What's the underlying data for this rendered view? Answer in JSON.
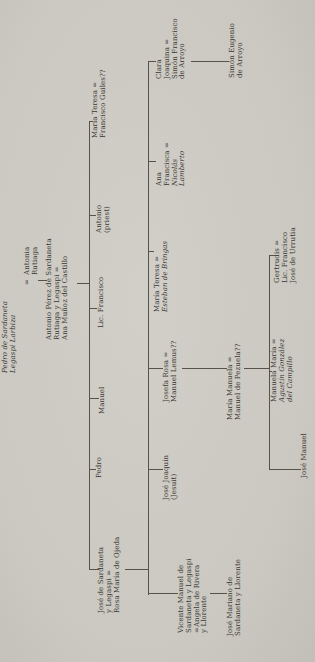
{
  "page": {
    "background_color": "#cdcac3",
    "ink_color": "#3a3732",
    "line_color": "#57534c",
    "rotation_deg": -90
  },
  "tree": {
    "nodes": [
      {
        "id": "pedro-sardaneta-legaspi",
        "x": 289,
        "y": 2,
        "lines": [
          {
            "t": "Pedro de Sardaneta",
            "i": true
          },
          {
            "t": "Legaspi Larbiza",
            "i": true
          }
        ]
      },
      {
        "id": "g1-equals",
        "x": 377,
        "y": 24,
        "lines": [
          {
            "t": "="
          }
        ]
      },
      {
        "id": "antonia-rutiaga",
        "x": 387,
        "y": 24,
        "lines": [
          {
            "t": "Antonia"
          },
          {
            "t": "Rutiaga"
          }
        ]
      },
      {
        "id": "antonio-perez-de-sardaneta",
        "x": 322,
        "y": 46,
        "lines": [
          {
            "t": "Antonio Pérez de Sardaneta"
          },
          {
            "t": "Rutiaga y Legaspi ="
          },
          {
            "t": "Ana Muñoz del Castillo"
          }
        ]
      },
      {
        "id": "jose-de-sardaneta-y-legaspi",
        "x": 49,
        "y": 98,
        "lines": [
          {
            "t": "José de Sardaneta"
          },
          {
            "t": "y Legaspi ="
          },
          {
            "t": "Rosa María de Ojeda"
          }
        ]
      },
      {
        "id": "pedro",
        "x": 184,
        "y": 96,
        "lines": [
          {
            "t": "Pedro"
          }
        ]
      },
      {
        "id": "manuel",
        "x": 248,
        "y": 99,
        "lines": [
          {
            "t": "Manuel"
          }
        ]
      },
      {
        "id": "lic-francisco",
        "x": 334,
        "y": 98,
        "lines": [
          {
            "t": "Lic. Francisco"
          }
        ]
      },
      {
        "id": "antonio-priest",
        "x": 429,
        "y": 96,
        "lines": [
          {
            "t": "Antonio"
          },
          {
            "t": "(priest)"
          }
        ]
      },
      {
        "id": "maria-teresa-guiles",
        "x": 524,
        "y": 92,
        "lines": [
          {
            "t": "María Teresa ="
          },
          {
            "t": "Francisco Guiles??"
          }
        ]
      },
      {
        "id": "vicente-manuel-de-sardaneta",
        "x": 29,
        "y": 178,
        "lines": [
          {
            "t": "Vicente Manuel de"
          },
          {
            "t": "Sardaneta y Legaspi"
          },
          {
            "t": "=Angela de Rivera"
          },
          {
            "t": "y Llorente"
          }
        ]
      },
      {
        "id": "jose-joaquin-jesuit",
        "x": 162,
        "y": 163,
        "lines": [
          {
            "t": "José Joaquín"
          },
          {
            "t": "(Jesuit)"
          }
        ]
      },
      {
        "id": "josefa-rosa",
        "x": 260,
        "y": 163,
        "lines": [
          {
            "t": "Josefa Rosa ="
          },
          {
            "t": "Manuel Lemus??"
          }
        ]
      },
      {
        "id": "maria-teresa-bringas",
        "x": 350,
        "y": 154,
        "lines": [
          {
            "t": "María Teresa ="
          },
          {
            "t": "Esteban de Bringas",
            "i": true
          }
        ]
      },
      {
        "id": "ana-francisca",
        "x": 476,
        "y": 156,
        "lines": [
          {
            "t": "Ana"
          },
          {
            "t": "Francisca ="
          },
          {
            "t": "Nicolás",
            "i": true
          },
          {
            "t": "Lamberto",
            "i": true
          }
        ]
      },
      {
        "id": "clara-joaquina",
        "x": 583,
        "y": 156,
        "lines": [
          {
            "t": "Clara"
          },
          {
            "t": "Joaquina ="
          },
          {
            "t": "Simón Francisco"
          },
          {
            "t": "de Arroyo"
          }
        ]
      },
      {
        "id": "jose-mariano",
        "x": 26,
        "y": 227,
        "lines": [
          {
            "t": "José Mariano de"
          },
          {
            "t": "Sardaneta y Llorente"
          }
        ]
      },
      {
        "id": "maria-manuela",
        "x": 242,
        "y": 227,
        "lines": [
          {
            "t": "María Manuela ="
          },
          {
            "t": "Manuel de Pezuela??"
          }
        ]
      },
      {
        "id": "simon-eugenio-de-arroyo",
        "x": 584,
        "y": 229,
        "lines": [
          {
            "t": "Simón Eugenio"
          },
          {
            "t": "de Arroyo"
          }
        ]
      },
      {
        "id": "jose-manuel",
        "x": 184,
        "y": 301,
        "lines": [
          {
            "t": "José Manuel"
          }
        ]
      },
      {
        "id": "manuela-maria",
        "x": 260,
        "y": 271,
        "lines": [
          {
            "t": "Manuela María ="
          },
          {
            "t": "Agustín González",
            "i": true
          },
          {
            "t": "del Campillo",
            "i": true
          }
        ]
      },
      {
        "id": "gertrudis",
        "x": 379,
        "y": 274,
        "lines": [
          {
            "t": "Gertrudis ="
          },
          {
            "t": "Lic. Francisco"
          },
          {
            "t": "José de Urrutia"
          }
        ]
      }
    ],
    "connectors": [
      {
        "id": "g1-descent",
        "type": "v",
        "x": 381,
        "y": 38,
        "len": 9
      },
      {
        "id": "g2-descent",
        "type": "v",
        "x": 378,
        "y": 77,
        "len": 13
      },
      {
        "id": "gen3-sibling-line",
        "type": "h",
        "x": 92,
        "y": 89,
        "len": 448
      },
      {
        "id": "stub-jose-de-sardaneta",
        "type": "v",
        "x": 92,
        "y": 89,
        "len": 10
      },
      {
        "id": "stub-pedro",
        "type": "v",
        "x": 192,
        "y": 89,
        "len": 7
      },
      {
        "id": "stub-manuel",
        "type": "v",
        "x": 263,
        "y": 89,
        "len": 10
      },
      {
        "id": "stub-lic-francisco",
        "type": "v",
        "x": 353,
        "y": 89,
        "len": 8
      },
      {
        "id": "stub-antonio-priest",
        "type": "v",
        "x": 446,
        "y": 89,
        "len": 7
      },
      {
        "id": "stub-maria-teresa-guiles",
        "type": "v",
        "x": 540,
        "y": 89,
        "len": 4
      },
      {
        "id": "jose-descent",
        "type": "v",
        "x": 92,
        "y": 125,
        "len": 23
      },
      {
        "id": "gen4-sibling-line",
        "type": "h",
        "x": 67,
        "y": 148,
        "len": 533
      },
      {
        "id": "stub-vicente",
        "type": "v",
        "x": 68,
        "y": 148,
        "len": 30
      },
      {
        "id": "stub-jose-joaquin",
        "type": "v",
        "x": 192,
        "y": 148,
        "len": 15
      },
      {
        "id": "stub-josefa-rosa",
        "type": "v",
        "x": 293,
        "y": 148,
        "len": 15
      },
      {
        "id": "stub-maria-teresa-bringas",
        "type": "v",
        "x": 410,
        "y": 148,
        "len": 6
      },
      {
        "id": "stub-ana-francisca",
        "type": "v",
        "x": 500,
        "y": 148,
        "len": 8
      },
      {
        "id": "stub-clara-joaquina",
        "type": "v",
        "x": 600,
        "y": 148,
        "len": 8
      },
      {
        "id": "vicente-descent",
        "type": "v",
        "x": 68,
        "y": 210,
        "len": 17
      },
      {
        "id": "josefa-descent",
        "type": "v",
        "x": 293,
        "y": 182,
        "len": 45
      },
      {
        "id": "maria-manuela-descent",
        "type": "v",
        "x": 293,
        "y": 244,
        "len": 25
      },
      {
        "id": "clara-descent",
        "type": "v",
        "x": 600,
        "y": 191,
        "len": 38
      },
      {
        "id": "gen6-sibling-line",
        "type": "h",
        "x": 192,
        "y": 269,
        "len": 214
      },
      {
        "id": "stub-jose-manuel",
        "type": "v",
        "x": 192,
        "y": 269,
        "len": 32
      },
      {
        "id": "stub-manuela-maria",
        "type": "v",
        "x": 290,
        "y": 269,
        "len": 3
      },
      {
        "id": "stub-gertrudis",
        "type": "v",
        "x": 406,
        "y": 269,
        "len": 6
      }
    ]
  }
}
